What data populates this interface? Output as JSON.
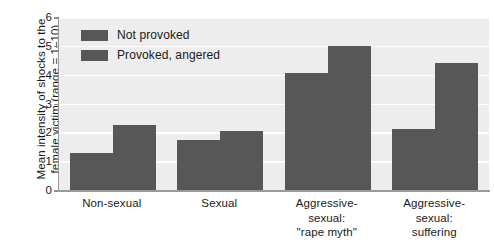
{
  "chart_data": {
    "type": "bar",
    "title": "",
    "subtitle": "",
    "xlabel": "",
    "ylabel": "Mean intensity of shocks to the female victim (range = 1–10)",
    "ylim": [
      0,
      6
    ],
    "yticks": [
      0,
      1,
      2,
      3,
      4,
      5,
      6
    ],
    "ytick_labels": [
      "0",
      "1",
      "2",
      "3",
      "4",
      "5",
      "6"
    ],
    "grid": true,
    "grid_axis": "y",
    "legend_position": "upper-left-inside",
    "categories": [
      "Non-sexual",
      "Sexual",
      "Aggressive-sexual: \"rape myth\"",
      "Aggressive-sexual: suffering"
    ],
    "category_lines": [
      [
        "Non-sexual"
      ],
      [
        "Sexual"
      ],
      [
        "Aggressive-",
        "sexual:",
        "\"rape myth\""
      ],
      [
        "Aggressive-",
        "sexual:",
        "suffering"
      ]
    ],
    "series": [
      {
        "name": "Not provoked",
        "values": [
          1.3,
          1.75,
          4.05,
          2.1
        ],
        "color": "#575757"
      },
      {
        "name": "Provoked, angered",
        "values": [
          2.25,
          2.05,
          5.0,
          4.4
        ],
        "color": "#575757"
      }
    ],
    "bar_color": "#575757",
    "plot_background": "#ededed",
    "gridline_color": "#fdfdfd",
    "axis_color": "#9a9a9a"
  },
  "legend": {
    "items": [
      {
        "label": "Not provoked"
      },
      {
        "label": "Provoked, angered"
      }
    ]
  }
}
